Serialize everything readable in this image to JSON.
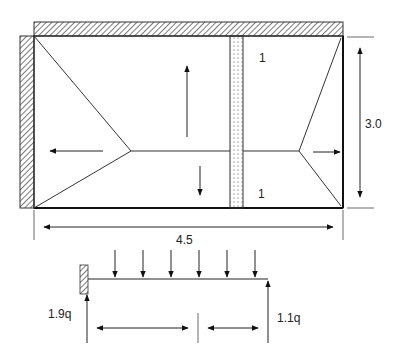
{
  "diagram": {
    "type": "two-way slab yield line / load distribution",
    "slab": {
      "panel_labels": [
        "1",
        "1"
      ],
      "width_dim": "4.5",
      "height_dim": "3.0",
      "supports": [
        "top-wall-hatched",
        "left-wall-hatched",
        "dotted-strip"
      ],
      "load_direction_arrows": [
        "left",
        "up",
        "down",
        "right"
      ]
    },
    "beam": {
      "left_reaction": "1.9q",
      "right_reaction": "1.1q",
      "load_arrow_count": 6
    },
    "colors": {
      "line": "#222222",
      "hatch": "#333333",
      "background": "#ffffff"
    }
  }
}
